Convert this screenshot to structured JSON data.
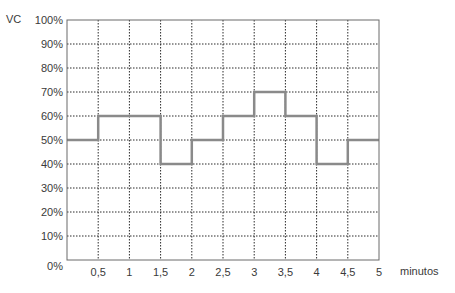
{
  "chart_data": {
    "type": "line",
    "subtype": "step",
    "title": "",
    "xlabel": "minutos",
    "ylabel": "VC",
    "x_ticks": [
      "0,5",
      "1",
      "1,5",
      "2",
      "2,5",
      "3",
      "3,5",
      "4",
      "4,5",
      "5"
    ],
    "y_ticks": [
      "0%",
      "10%",
      "20%",
      "30%",
      "40%",
      "50%",
      "60%",
      "70%",
      "80%",
      "90%",
      "100%"
    ],
    "xlim": [
      0,
      5
    ],
    "ylim": [
      0,
      100
    ],
    "grid": true,
    "grid_style": "dotted",
    "legend": null,
    "series": [
      {
        "name": "VC",
        "color": "#8a8a8a",
        "segments": [
          {
            "x_start": 0,
            "x_end": 0.5,
            "y": 50
          },
          {
            "x_start": 0.5,
            "x_end": 1.5,
            "y": 60
          },
          {
            "x_start": 1.5,
            "x_end": 2,
            "y": 40
          },
          {
            "x_start": 2,
            "x_end": 2.5,
            "y": 50
          },
          {
            "x_start": 2.5,
            "x_end": 3,
            "y": 60
          },
          {
            "x_start": 3,
            "x_end": 3.5,
            "y": 70
          },
          {
            "x_start": 3.5,
            "x_end": 4,
            "y": 60
          },
          {
            "x_start": 4,
            "x_end": 4.5,
            "y": 40
          },
          {
            "x_start": 4.5,
            "x_end": 5,
            "y": 50
          }
        ]
      }
    ]
  },
  "colors": {
    "axis": "#6a6a6a",
    "grid": "#2a2a2a",
    "line": "#8a8a8a",
    "text": "#3a3a3a"
  }
}
